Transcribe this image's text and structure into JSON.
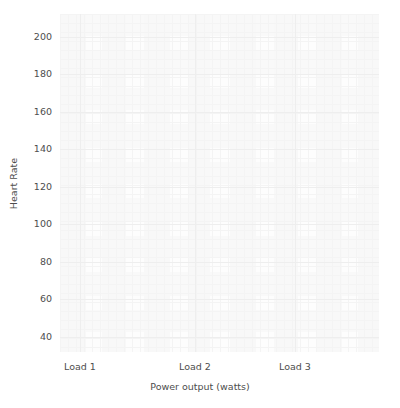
{
  "chart_data": {
    "type": "scatter",
    "title": "",
    "xlabel": "Power output (watts)",
    "ylabel": "Heart Rate",
    "grid": true,
    "legend": null,
    "xtick_labels": [
      "Load 1",
      "Load 2",
      "Load 3"
    ],
    "xtick_positions_px": [
      80,
      195,
      295
    ],
    "ytick_labels": [
      "40",
      "60",
      "80",
      "100",
      "120",
      "140",
      "160",
      "180",
      "200"
    ],
    "ytick_values": [
      40,
      60,
      80,
      100,
      120,
      140,
      160,
      180,
      200
    ],
    "ylim": [
      32,
      212
    ],
    "xlim_categories": [
      "Load 1",
      "Load 2",
      "Load 3"
    ],
    "series": [
      {
        "name": "",
        "x": [],
        "y": []
      }
    ],
    "annotations": [],
    "note": "Empty axes: no data points, markers, lines or legend are rendered inside the plotting area."
  },
  "figure": {
    "background_color": "#ffffff",
    "plot_background_color": "#fdfdfd",
    "grid_color_major": "#eeeeee",
    "grid_color_minor": "#f4f4f4",
    "tick_label_color": "#4d4d4d",
    "axis_label_color": "#4d4d4d"
  },
  "yticks": [
    {
      "label": "200",
      "value": 200
    },
    {
      "label": "180",
      "value": 180
    },
    {
      "label": "160",
      "value": 160
    },
    {
      "label": "140",
      "value": 140
    },
    {
      "label": "120",
      "value": 120
    },
    {
      "label": "100",
      "value": 100
    },
    {
      "label": "80",
      "value": 80
    },
    {
      "label": "60",
      "value": 60
    },
    {
      "label": "40",
      "value": 40
    }
  ],
  "xticks": [
    {
      "label": "Load 1"
    },
    {
      "label": "Load 2"
    },
    {
      "label": "Load 3"
    }
  ],
  "axis_titles": {
    "x": "Power output (watts)",
    "y": "Heart Rate"
  }
}
